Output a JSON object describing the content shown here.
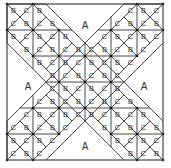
{
  "diagram": {
    "colors": {
      "line": "#333333",
      "background": "#ffffff",
      "dot": "#111111"
    },
    "frame": {
      "x": 7,
      "y": 4,
      "size": 156
    },
    "grid_units": 6,
    "large_pieces": [
      {
        "label": "A",
        "x": 85,
        "y": 25
      },
      {
        "label": "A",
        "x": 28,
        "y": 86
      },
      {
        "label": "A",
        "x": 144,
        "y": 86
      },
      {
        "label": "A",
        "x": 85,
        "y": 146
      }
    ],
    "small_piece_labels": [
      "B",
      "C"
    ],
    "legend_note": "B and C triangles fill the diagonal X bands"
  }
}
